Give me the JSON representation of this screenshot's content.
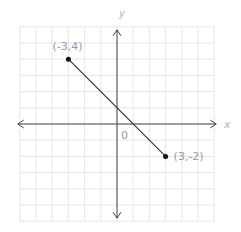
{
  "chart_data": {
    "type": "line",
    "title": "",
    "xlabel": "x",
    "ylabel": "y",
    "xlim": [
      -6,
      6
    ],
    "ylim": [
      -6,
      6
    ],
    "grid": true,
    "origin_label": "0",
    "series": [
      {
        "name": "segment",
        "points": [
          {
            "x": -3,
            "y": 4,
            "label": "(-3,4)"
          },
          {
            "x": 3,
            "y": -2,
            "label": "(3,-2)"
          }
        ]
      }
    ]
  },
  "colors": {
    "grid": "#e6e6e6",
    "axis": "#444444",
    "line": "#333333",
    "point": "#111111",
    "label": "#9a9a9a"
  }
}
